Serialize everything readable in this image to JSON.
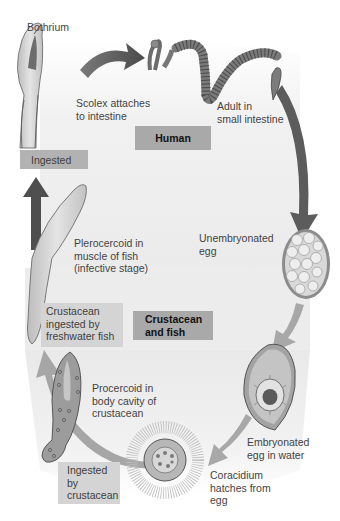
{
  "diagram": {
    "type": "life-cycle",
    "hosts": [
      {
        "id": "human",
        "label": "Human"
      },
      {
        "id": "crustacean-fish",
        "label": "Crustacean\nand fish"
      }
    ],
    "stages": [
      {
        "id": "scolex",
        "label": "Scolex attaches\nto intestine"
      },
      {
        "id": "bothrium",
        "label": "Bothrium"
      },
      {
        "id": "adult",
        "label": "Adult in\nsmall intestine"
      },
      {
        "id": "unembryonated-egg",
        "label": "Unembryonated\negg"
      },
      {
        "id": "embryonated-egg",
        "label": "Embryonated\negg in water"
      },
      {
        "id": "coracidium",
        "label": "Coracidium\nhatches from\negg"
      },
      {
        "id": "procercoid",
        "label": "Procercoid in\nbody cavity of\ncrustacean"
      },
      {
        "id": "plerocercoid",
        "label": "Plerocercoid in\nmuscle of fish\n(infective stage)"
      }
    ],
    "events": [
      {
        "id": "ingested",
        "label": "Ingested"
      },
      {
        "id": "crustacean-ingested",
        "label": "Crustacean\ningested by\nfreshwater fish"
      },
      {
        "id": "ingested-by-crustacean",
        "label": "Ingested\nby\ncrustacean"
      }
    ],
    "colors": {
      "background": "#ffffff",
      "host_band": "#efefef",
      "host_box": "#a9a9a9",
      "event_box": "#b2b2b2",
      "arrow_dark": "#5a5a5a",
      "arrow_light": "#a8a8a8"
    }
  }
}
